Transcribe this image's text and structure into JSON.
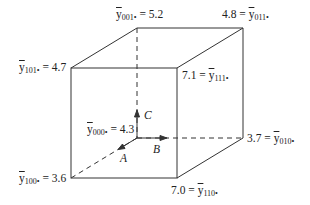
{
  "diagram": {
    "type": "cube-design-space",
    "symbol": "y",
    "dot": "•",
    "axes": {
      "A": "A",
      "B": "B",
      "C": "C"
    },
    "corners": [
      {
        "id": "001",
        "position": "back-top-left",
        "subscript": "001",
        "value": "5.2",
        "label_side": "left"
      },
      {
        "id": "011",
        "position": "back-top-right",
        "subscript": "011",
        "value": "4.8",
        "label_side": "right"
      },
      {
        "id": "101",
        "position": "front-top-left",
        "subscript": "101",
        "value": "4.7",
        "label_side": "left"
      },
      {
        "id": "111",
        "position": "front-top-right",
        "subscript": "111",
        "value": "7.1",
        "label_side": "right"
      },
      {
        "id": "000",
        "position": "back-bottom-left",
        "subscript": "000",
        "value": "4.3",
        "label_side": "left"
      },
      {
        "id": "010",
        "position": "back-bottom-right",
        "subscript": "010",
        "value": "3.7",
        "label_side": "right"
      },
      {
        "id": "100",
        "position": "front-bottom-left",
        "subscript": "100",
        "value": "3.6",
        "label_side": "left"
      },
      {
        "id": "110",
        "position": "front-bottom-right",
        "subscript": "110",
        "value": "7.0",
        "label_side": "right"
      }
    ],
    "eq": "="
  }
}
